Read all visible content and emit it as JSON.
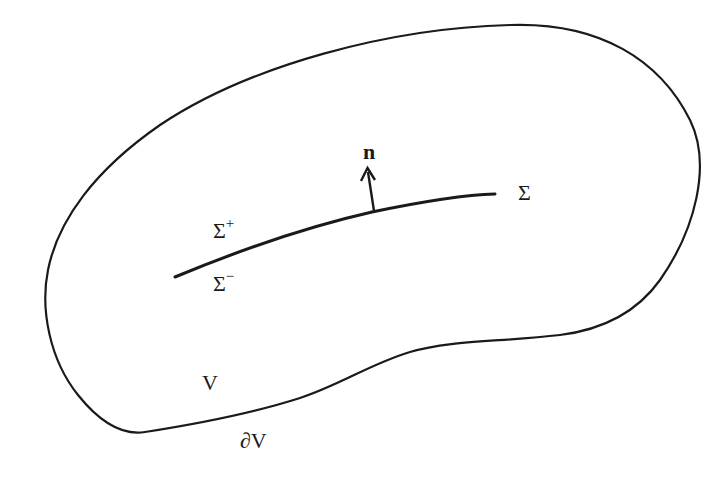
{
  "diagram": {
    "type": "region-with-internal-surface",
    "colors": {
      "stroke": "#1a1a1a",
      "background": "#ffffff"
    },
    "labels": {
      "surface": "Σ",
      "surface_plus_base": "Σ",
      "surface_plus_sup": "+",
      "surface_minus_base": "Σ",
      "surface_minus_sup": "−",
      "normal": "n",
      "volume": "V",
      "boundary": "∂V"
    },
    "elements": [
      {
        "id": "boundary",
        "kind": "closed-curve",
        "label": "∂V"
      },
      {
        "id": "surface",
        "kind": "open-curve",
        "label": "Σ"
      },
      {
        "id": "normal",
        "kind": "arrow",
        "label": "n",
        "attached_to": "surface"
      },
      {
        "id": "volume",
        "kind": "region",
        "label": "V"
      }
    ]
  }
}
